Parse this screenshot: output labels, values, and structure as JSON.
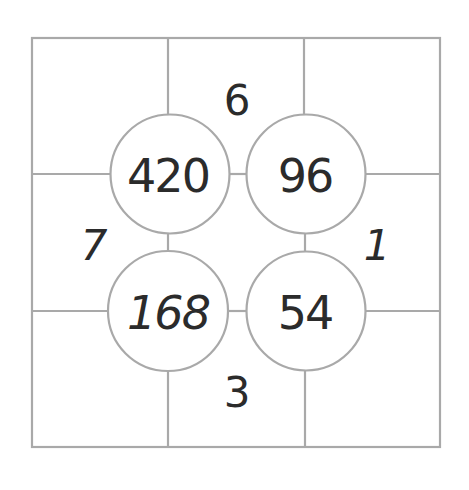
{
  "puzzle": {
    "line_color": "#a9a9a9",
    "text_color": "#2b2b2b",
    "circles": [
      {
        "id": "top-left",
        "value": "420"
      },
      {
        "id": "top-right",
        "value": "96"
      },
      {
        "id": "bottom-left",
        "value": "168"
      },
      {
        "id": "bottom-right",
        "value": "54"
      }
    ],
    "edges": {
      "top": "6",
      "left": "7",
      "right": "1",
      "bottom": "3"
    }
  }
}
